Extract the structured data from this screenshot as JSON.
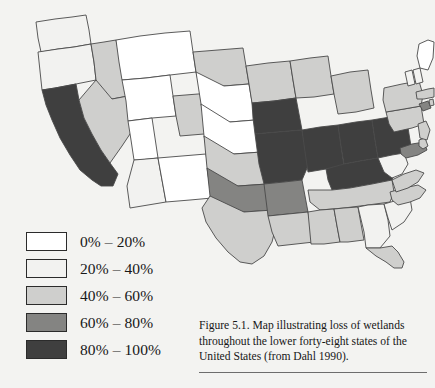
{
  "figure": {
    "caption": "Figure 5.1. Map illustrating loss of wetlands throughout the lower forty-eight states of the United States (from Dahl 1990).",
    "title": "Map illustrating loss of wetlands throughout the lower forty-eight states of the United States",
    "source": "from Dahl 1990",
    "number": "Figure 5.1."
  },
  "legend": {
    "title": "Percent loss of wetlands",
    "items": [
      {
        "label": "0% – 20%",
        "color": "#ffffff",
        "min": 0,
        "max": 20
      },
      {
        "label": "20% – 40%",
        "color": "#f2f2f0",
        "min": 20,
        "max": 40
      },
      {
        "label": "40% – 60%",
        "color": "#cfcfcd",
        "min": 40,
        "max": 60
      },
      {
        "label": "60% – 80%",
        "color": "#848482",
        "min": 60,
        "max": 80
      },
      {
        "label": "80% – 100%",
        "color": "#3f3f3f",
        "min": 80,
        "max": 100
      }
    ]
  },
  "chart_data": {
    "type": "map",
    "subtype": "choropleth",
    "title": "Map illustrating loss of wetlands throughout the lower forty-eight states of the United States",
    "region": "Contiguous United States (lower forty-eight states)",
    "variable": "Percent loss of wetlands",
    "units": "percent",
    "classes": [
      "0% – 20%",
      "20% – 40%",
      "40% – 60%",
      "60% – 80%",
      "80% – 100%"
    ],
    "class_colors": [
      "#ffffff",
      "#f2f2f0",
      "#cfcfcd",
      "#848482",
      "#3f3f3f"
    ],
    "grid": false,
    "legend_position": "lower-left",
    "values": [
      {
        "state": "Washington",
        "code": "WA",
        "class": "20% – 40%",
        "color": "#f2f2f0"
      },
      {
        "state": "Oregon",
        "code": "OR",
        "class": "20% – 40%",
        "color": "#f2f2f0"
      },
      {
        "state": "California",
        "code": "CA",
        "class": "80% – 100%",
        "color": "#3f3f3f"
      },
      {
        "state": "Idaho",
        "code": "ID",
        "class": "40% – 60%",
        "color": "#cfcfcd"
      },
      {
        "state": "Nevada",
        "code": "NV",
        "class": "40% – 60%",
        "color": "#cfcfcd"
      },
      {
        "state": "Montana",
        "code": "MT",
        "class": "0% – 20%",
        "color": "#ffffff"
      },
      {
        "state": "Wyoming",
        "code": "WY",
        "class": "0% – 20%",
        "color": "#ffffff"
      },
      {
        "state": "Utah",
        "code": "UT",
        "class": "0% – 20%",
        "color": "#ffffff"
      },
      {
        "state": "Arizona",
        "code": "AZ",
        "class": "20% – 40%",
        "color": "#f2f2f0"
      },
      {
        "state": "New Mexico",
        "code": "NM",
        "class": "0% – 20%",
        "color": "#ffffff"
      },
      {
        "state": "Colorado",
        "code": "CO",
        "class": "40% – 60%",
        "color": "#cfcfcd"
      },
      {
        "state": "North Dakota",
        "code": "ND",
        "class": "40% – 60%",
        "color": "#cfcfcd"
      },
      {
        "state": "South Dakota",
        "code": "SD",
        "class": "0% – 20%",
        "color": "#ffffff"
      },
      {
        "state": "Nebraska",
        "code": "NE",
        "class": "0% – 20%",
        "color": "#ffffff"
      },
      {
        "state": "Kansas",
        "code": "KS",
        "class": "40% – 60%",
        "color": "#cfcfcd"
      },
      {
        "state": "Oklahoma",
        "code": "OK",
        "class": "60% – 80%",
        "color": "#848482"
      },
      {
        "state": "Texas",
        "code": "TX",
        "class": "40% – 60%",
        "color": "#cfcfcd"
      },
      {
        "state": "Minnesota",
        "code": "MN",
        "class": "40% – 60%",
        "color": "#cfcfcd"
      },
      {
        "state": "Iowa",
        "code": "IA",
        "class": "80% – 100%",
        "color": "#3f3f3f"
      },
      {
        "state": "Missouri",
        "code": "MO",
        "class": "80% – 100%",
        "color": "#3f3f3f"
      },
      {
        "state": "Arkansas",
        "code": "AR",
        "class": "60% – 80%",
        "color": "#848482"
      },
      {
        "state": "Louisiana",
        "code": "LA",
        "class": "40% – 60%",
        "color": "#cfcfcd"
      },
      {
        "state": "Wisconsin",
        "code": "WI",
        "class": "40% – 60%",
        "color": "#cfcfcd"
      },
      {
        "state": "Illinois",
        "code": "IL",
        "class": "80% – 100%",
        "color": "#3f3f3f"
      },
      {
        "state": "Michigan",
        "code": "MI",
        "class": "40% – 60%",
        "color": "#cfcfcd"
      },
      {
        "state": "Indiana",
        "code": "IN",
        "class": "80% – 100%",
        "color": "#3f3f3f"
      },
      {
        "state": "Ohio",
        "code": "OH",
        "class": "80% – 100%",
        "color": "#3f3f3f"
      },
      {
        "state": "Kentucky",
        "code": "KY",
        "class": "80% – 100%",
        "color": "#3f3f3f"
      },
      {
        "state": "Tennessee",
        "code": "TN",
        "class": "40% – 60%",
        "color": "#cfcfcd"
      },
      {
        "state": "Mississippi",
        "code": "MS",
        "class": "40% – 60%",
        "color": "#cfcfcd"
      },
      {
        "state": "Alabama",
        "code": "AL",
        "class": "40% – 60%",
        "color": "#cfcfcd"
      },
      {
        "state": "Georgia",
        "code": "GA",
        "class": "20% – 40%",
        "color": "#f2f2f0"
      },
      {
        "state": "Florida",
        "code": "FL",
        "class": "40% – 60%",
        "color": "#cfcfcd"
      },
      {
        "state": "South Carolina",
        "code": "SC",
        "class": "20% – 40%",
        "color": "#f2f2f0"
      },
      {
        "state": "North Carolina",
        "code": "NC",
        "class": "40% – 60%",
        "color": "#cfcfcd"
      },
      {
        "state": "Virginia",
        "code": "VA",
        "class": "40% – 60%",
        "color": "#cfcfcd"
      },
      {
        "state": "West Virginia",
        "code": "WV",
        "class": "20% – 40%",
        "color": "#f2f2f0"
      },
      {
        "state": "Maryland",
        "code": "MD",
        "class": "60% – 80%",
        "color": "#848482"
      },
      {
        "state": "Delaware",
        "code": "DE",
        "class": "40% – 60%",
        "color": "#cfcfcd"
      },
      {
        "state": "Pennsylvania",
        "code": "PA",
        "class": "40% – 60%",
        "color": "#cfcfcd"
      },
      {
        "state": "New Jersey",
        "code": "NJ",
        "class": "40% – 60%",
        "color": "#cfcfcd"
      },
      {
        "state": "New York",
        "code": "NY",
        "class": "40% – 60%",
        "color": "#cfcfcd"
      },
      {
        "state": "Connecticut",
        "code": "CT",
        "class": "60% – 80%",
        "color": "#848482"
      },
      {
        "state": "Rhode Island",
        "code": "RI",
        "class": "40% – 60%",
        "color": "#cfcfcd"
      },
      {
        "state": "Massachusetts",
        "code": "MA",
        "class": "40% – 60%",
        "color": "#cfcfcd"
      },
      {
        "state": "Vermont",
        "code": "VT",
        "class": "20% – 40%",
        "color": "#f2f2f0"
      },
      {
        "state": "New Hampshire",
        "code": "NH",
        "class": "20% – 40%",
        "color": "#f2f2f0"
      },
      {
        "state": "Maine",
        "code": "ME",
        "class": "0% – 20%",
        "color": "#ffffff"
      }
    ]
  }
}
